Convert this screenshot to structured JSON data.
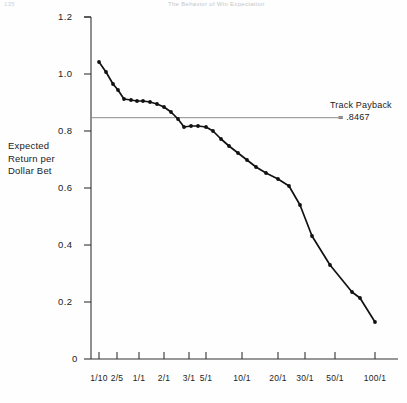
{
  "scan_header": {
    "left_fragment": "135",
    "center_fragment": "The Behavior of Win Expectation"
  },
  "annotation": {
    "line1": "Track Payback",
    "line2": "=  .8467",
    "value": 0.8467
  },
  "axis": {
    "y_label_line1": "Expected",
    "y_label_line2": "Return per",
    "y_label_line3": "Dollar Bet"
  },
  "chart_data": {
    "type": "line",
    "title": "",
    "subtitle": "",
    "xlabel": "",
    "ylabel": "Expected Return per Dollar Bet",
    "ylim": [
      0,
      1.2
    ],
    "yticks": [
      0,
      0.2,
      0.4,
      0.6,
      0.8,
      1.0,
      1.2
    ],
    "ytick_labels": [
      "0",
      "0.2",
      "0.4",
      "0.6",
      "0.8",
      "1.0",
      "1.2"
    ],
    "xtick_labels": [
      "1/10",
      "2/5",
      "1/1",
      "2/1",
      "3/1",
      "5/1",
      "10/1",
      "20/1",
      "30/1",
      "50/1",
      "100/1"
    ],
    "xtick_positions": [
      99,
      117,
      139,
      164,
      189,
      206,
      242,
      278,
      305,
      335,
      375
    ],
    "grid": false,
    "legend": false,
    "markers": "filled-circle",
    "reference_line": {
      "label": "Track Payback = .8467",
      "value": 0.8467,
      "orientation": "horizontal"
    },
    "series": [
      {
        "name": "Expected Return per Dollar Bet",
        "x_labels": [
          "1/10",
          "",
          "",
          "2/5",
          "",
          "",
          "1/1",
          "",
          "",
          "2/1",
          "",
          "3/1",
          "",
          "",
          "5/1",
          "",
          "",
          "",
          "10/1",
          "",
          "",
          "20/1",
          "",
          "30/1",
          "",
          "",
          "50/1",
          "",
          "100/1",
          ""
        ],
        "points": [
          {
            "px": 99,
            "py": 62,
            "value": 1.042
          },
          {
            "px": 106,
            "py": 72,
            "value": 1.007
          },
          {
            "px": 113,
            "py": 84,
            "value": 0.965
          },
          {
            "px": 118,
            "py": 90,
            "value": 0.944
          },
          {
            "px": 124,
            "py": 99,
            "value": 0.912
          },
          {
            "px": 131,
            "py": 100,
            "value": 0.909
          },
          {
            "px": 137,
            "py": 101,
            "value": 0.905
          },
          {
            "px": 143,
            "py": 101,
            "value": 0.905
          },
          {
            "px": 150,
            "py": 102,
            "value": 0.902
          },
          {
            "px": 157,
            "py": 104,
            "value": 0.895
          },
          {
            "px": 164,
            "py": 107,
            "value": 0.884
          },
          {
            "px": 171,
            "py": 112,
            "value": 0.867
          },
          {
            "px": 178,
            "py": 119,
            "value": 0.842
          },
          {
            "px": 184,
            "py": 127,
            "value": 0.814
          },
          {
            "px": 191,
            "py": 126,
            "value": 0.817
          },
          {
            "px": 198,
            "py": 126,
            "value": 0.817
          },
          {
            "px": 206,
            "py": 127,
            "value": 0.814
          },
          {
            "px": 213,
            "py": 131,
            "value": 0.8
          },
          {
            "px": 221,
            "py": 139,
            "value": 0.772
          },
          {
            "px": 229,
            "py": 146,
            "value": 0.747
          },
          {
            "px": 238,
            "py": 153,
            "value": 0.723
          },
          {
            "px": 247,
            "py": 160,
            "value": 0.698
          },
          {
            "px": 256,
            "py": 167,
            "value": 0.674
          },
          {
            "px": 266,
            "py": 173,
            "value": 0.653
          },
          {
            "px": 278,
            "py": 179,
            "value": 0.632
          },
          {
            "px": 289,
            "py": 186,
            "value": 0.607
          },
          {
            "px": 300,
            "py": 205,
            "value": 0.54
          },
          {
            "px": 312,
            "py": 236,
            "value": 0.432
          },
          {
            "px": 330,
            "py": 265,
            "value": 0.33
          },
          {
            "px": 352,
            "py": 292,
            "value": 0.235
          },
          {
            "px": 360,
            "py": 298,
            "value": 0.214
          },
          {
            "px": 375,
            "py": 322,
            "value": 0.13
          }
        ]
      }
    ]
  }
}
